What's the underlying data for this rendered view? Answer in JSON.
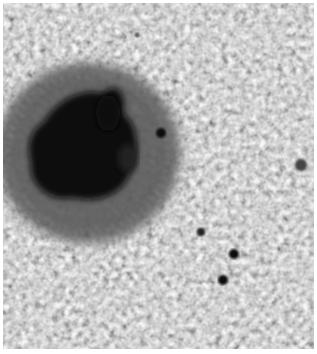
{
  "image": {
    "subject": "sunspot with surrounding solar granulation",
    "colors": {
      "photosphere": "#a8a8a8",
      "granule_light": "#c8c8c8",
      "intergranular_dark": "#8a8a8a",
      "penumbra": "#555555",
      "umbra": "#0a0a0a",
      "border": "#ffffff"
    },
    "features": [
      {
        "name": "umbra",
        "cx": 80,
        "cy": 150,
        "rx": 45,
        "ry": 50
      },
      {
        "name": "penumbra",
        "cx": 85,
        "cy": 150,
        "rx": 90,
        "ry": 88
      },
      {
        "name": "pore-1",
        "cx": 201,
        "cy": 232,
        "r": 4
      },
      {
        "name": "pore-2",
        "cx": 234,
        "cy": 254,
        "r": 5
      },
      {
        "name": "pore-3",
        "cx": 223,
        "cy": 280,
        "r": 5
      },
      {
        "name": "pore-4",
        "cx": 300,
        "cy": 165,
        "r": 6
      },
      {
        "name": "pore-5",
        "cx": 158,
        "cy": 133,
        "r": 5
      },
      {
        "name": "pore-6",
        "cx": 136,
        "cy": 35,
        "r": 2
      }
    ]
  }
}
